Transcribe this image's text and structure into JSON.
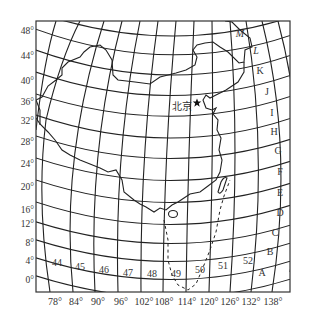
{
  "map": {
    "city": {
      "name": "北京",
      "marker": "star-icon",
      "x": 197,
      "y": 103,
      "label_x": 182,
      "label_y": 107
    },
    "lat_labels": [
      {
        "text": "48°",
        "y": 31
      },
      {
        "text": "44°",
        "y": 56
      },
      {
        "text": "40°",
        "y": 81
      },
      {
        "text": "36°",
        "y": 102
      },
      {
        "text": "32°",
        "y": 121
      },
      {
        "text": "28°",
        "y": 142
      },
      {
        "text": "24°",
        "y": 164
      },
      {
        "text": "20°",
        "y": 187
      },
      {
        "text": "16°",
        "y": 210
      },
      {
        "text": "12°",
        "y": 224
      },
      {
        "text": "8°",
        "y": 243
      },
      {
        "text": "4°",
        "y": 261
      },
      {
        "text": "0°",
        "y": 280
      }
    ],
    "lon_labels": [
      {
        "text": "78°",
        "x": 55
      },
      {
        "text": "84°",
        "x": 76
      },
      {
        "text": "90°",
        "x": 98
      },
      {
        "text": "96°",
        "x": 121
      },
      {
        "text": "102°",
        "x": 144
      },
      {
        "text": "108°",
        "x": 164
      },
      {
        "text": "114°",
        "x": 187
      },
      {
        "text": "120°",
        "x": 209
      },
      {
        "text": "126°",
        "x": 230
      },
      {
        "text": "132°",
        "x": 251
      },
      {
        "text": "138°",
        "x": 273
      }
    ],
    "zone_labels": [
      {
        "text": "44",
        "x": 57,
        "y": 263
      },
      {
        "text": "45",
        "x": 80,
        "y": 267
      },
      {
        "text": "46",
        "x": 104,
        "y": 270
      },
      {
        "text": "47",
        "x": 128,
        "y": 273
      },
      {
        "text": "48",
        "x": 152,
        "y": 274
      },
      {
        "text": "49",
        "x": 176,
        "y": 274
      },
      {
        "text": "50",
        "x": 200,
        "y": 270
      },
      {
        "text": "51",
        "x": 223,
        "y": 266
      },
      {
        "text": "52",
        "x": 248,
        "y": 261
      }
    ],
    "row_labels": [
      {
        "text": "M",
        "x": 240,
        "y": 34
      },
      {
        "text": "L",
        "x": 256,
        "y": 51
      },
      {
        "text": "K",
        "x": 260,
        "y": 71
      },
      {
        "text": "J",
        "x": 267,
        "y": 92
      },
      {
        "text": "I",
        "x": 272,
        "y": 113
      },
      {
        "text": "H",
        "x": 274,
        "y": 132
      },
      {
        "text": "G",
        "x": 278,
        "y": 151
      },
      {
        "text": "F",
        "x": 280,
        "y": 172
      },
      {
        "text": "E",
        "x": 280,
        "y": 193
      },
      {
        "text": "D",
        "x": 280,
        "y": 213
      },
      {
        "text": "C",
        "x": 275,
        "y": 233
      },
      {
        "text": "B",
        "x": 270,
        "y": 252
      },
      {
        "text": "A",
        "x": 262,
        "y": 273
      }
    ],
    "colors": {
      "line": "#222222",
      "text": "#333333",
      "background": "#ffffff"
    }
  }
}
